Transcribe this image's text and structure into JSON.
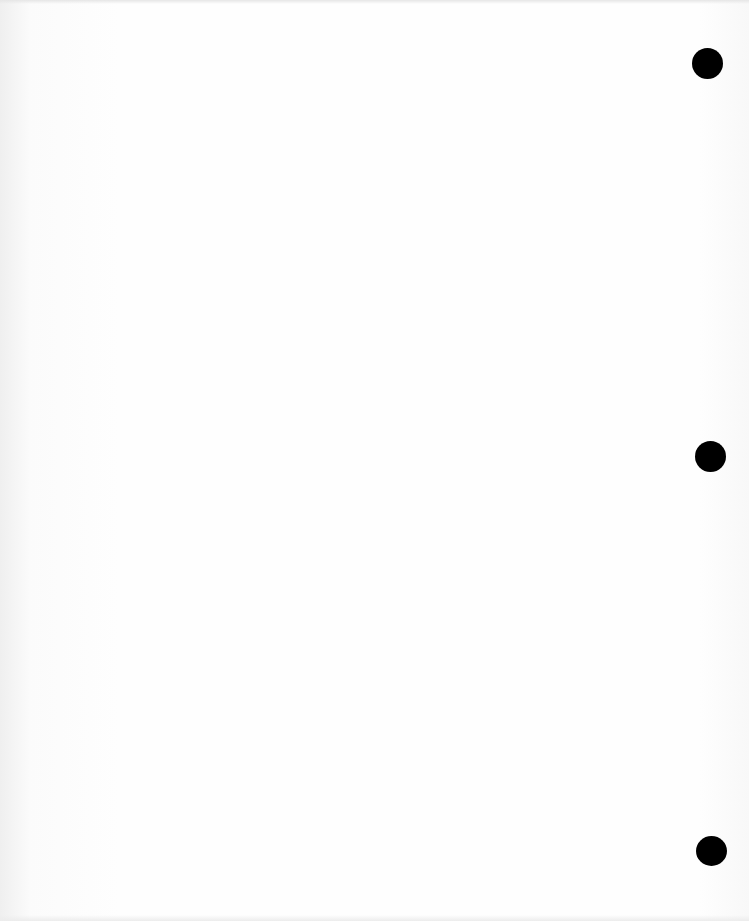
{
  "document": {
    "type": "blank scanned page",
    "text": "",
    "punch_holes": [
      {
        "cx": 708,
        "cy": 64,
        "r": 15
      },
      {
        "cx": 710,
        "cy": 456,
        "r": 15
      },
      {
        "cx": 711,
        "cy": 852,
        "r": 15
      }
    ],
    "colors": {
      "paper": "#fefefe",
      "hole": "#000000"
    }
  }
}
